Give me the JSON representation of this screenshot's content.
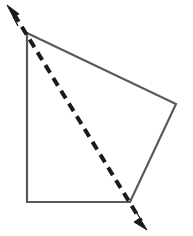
{
  "figure": {
    "background_color": "#ffffff",
    "canvas": {
      "width": 193,
      "height": 236
    },
    "shape": {
      "name": "quadrilateral",
      "stroke_color": "#5a5a5a",
      "stroke_width": 2.2,
      "fill": "none",
      "vertices": [
        {
          "label": "top-left-apex",
          "x": 27,
          "y": 33
        },
        {
          "label": "right",
          "x": 176,
          "y": 104
        },
        {
          "label": "bottom-right",
          "x": 130,
          "y": 202
        },
        {
          "label": "bottom-left",
          "x": 27,
          "y": 202
        }
      ],
      "points_attr": "27,33 176,104 130,202 27,202",
      "edges": [
        {
          "name": "top-edge",
          "from": "top-left-apex",
          "to": "right"
        },
        {
          "name": "right-edge",
          "from": "right",
          "to": "bottom-right"
        },
        {
          "name": "bottom-edge",
          "from": "bottom-right",
          "to": "bottom-left"
        },
        {
          "name": "left-edge",
          "from": "bottom-left",
          "to": "top-left-apex"
        }
      ]
    },
    "dashed_line": {
      "name": "dashed-double-arrow",
      "stroke_color": "#1a1a1a",
      "stroke_width": 4,
      "dash_pattern": "9 6",
      "start": {
        "x": 14,
        "y": 14
      },
      "end": {
        "x": 141,
        "y": 221
      },
      "x1": 14,
      "y1": 14,
      "x2": 141,
      "y2": 221,
      "passes_through": [
        "top-left-apex",
        "bottom-right"
      ],
      "arrowheads": [
        {
          "name": "arrowhead-upper-left",
          "direction": "up-left",
          "tip": {
            "x": 7,
            "y": 5
          },
          "fill": "#1a1a1a",
          "points_attr": "7,5 19,14 13,17 18,26"
        },
        {
          "name": "arrowhead-lower-right",
          "direction": "down-right",
          "tip": {
            "x": 147,
            "y": 230
          },
          "fill": "#1a1a1a",
          "points_attr": "147,230 134,222 140,218 135,210"
        }
      ]
    }
  }
}
